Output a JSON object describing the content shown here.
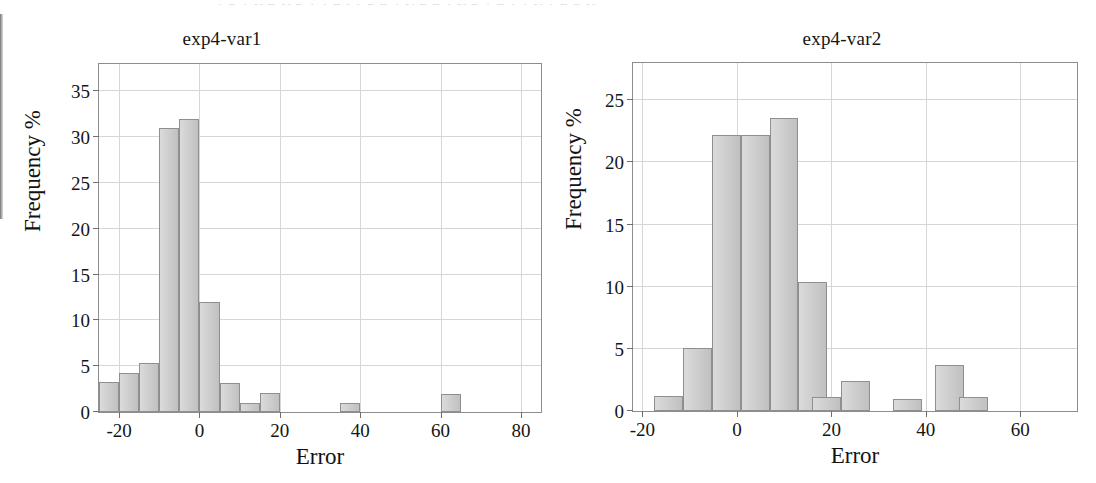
{
  "figure": {
    "artifact_text": "A R A N D N R A A E I  A R B A N R E  A N B A  E A  A N A E O N",
    "panels": [
      "left",
      "right"
    ]
  },
  "chart_data": [
    {
      "type": "bar",
      "title": "exp4-var1",
      "xlabel": "Error",
      "ylabel": "Frequency %",
      "xlim": [
        -25,
        85
      ],
      "ylim": [
        0,
        38
      ],
      "xticks": [
        -20,
        0,
        20,
        40,
        60,
        80
      ],
      "xtick_labels": [
        "-20",
        "0",
        "20",
        "40",
        "60",
        "80"
      ],
      "yticks": [
        0,
        5,
        10,
        15,
        20,
        25,
        30,
        35
      ],
      "ytick_labels": [
        "0",
        "5",
        "10",
        "15",
        "20",
        "25",
        "30",
        "35"
      ],
      "grid": true,
      "legend": "none",
      "bin_width": 5,
      "bin_lefts": [
        -25,
        -20,
        -15,
        -10,
        -5,
        0,
        5,
        10,
        15,
        35,
        60
      ],
      "bin_centers": [
        -22.5,
        -17.5,
        -12.5,
        -7.5,
        -2.5,
        2.5,
        7.5,
        12.5,
        17.5,
        37.5,
        62.5
      ],
      "values": [
        3.3,
        4.3,
        5.4,
        31.0,
        32.0,
        12.0,
        3.2,
        1.0,
        2.1,
        1.0,
        2.0
      ]
    },
    {
      "type": "bar",
      "title": "exp4-var2",
      "xlabel": "Error",
      "ylabel": "Frequency %",
      "xlim": [
        -22,
        72
      ],
      "ylim": [
        0,
        28
      ],
      "xticks": [
        -20,
        0,
        20,
        40,
        60
      ],
      "xtick_labels": [
        "-20",
        "0",
        "20",
        "40",
        "60"
      ],
      "yticks": [
        0,
        5,
        10,
        15,
        20,
        25
      ],
      "ytick_labels": [
        "0",
        "5",
        "10",
        "15",
        "20",
        "25"
      ],
      "grid": true,
      "legend": "none",
      "bin_width": 6.1,
      "bin_lefts": [
        -17.5,
        -11.4,
        -5.3,
        0.8,
        6.9,
        13.0,
        16.0,
        22.1,
        33.0,
        42.0,
        47.0
      ],
      "bin_centers": [
        -14.5,
        -8.4,
        -2.3,
        3.8,
        9.9,
        14.5,
        19.0,
        25.1,
        35.5,
        44.5,
        49.5
      ],
      "values": [
        1.2,
        5.1,
        22.2,
        22.2,
        23.6,
        10.4,
        1.1,
        2.4,
        1.0,
        3.7,
        1.1
      ]
    }
  ]
}
